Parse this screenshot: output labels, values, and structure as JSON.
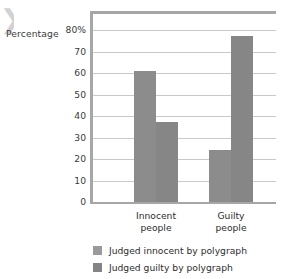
{
  "axis_title": "Percentage",
  "corner_mark": "❯",
  "chart_data": {
    "type": "bar",
    "title": "",
    "subtitle": "",
    "xlabel": "",
    "ylabel": "Percentage",
    "ylim": [
      0,
      80
    ],
    "ytick_values": [
      80,
      70,
      60,
      50,
      40,
      30,
      20,
      10,
      0
    ],
    "ytick_labels": [
      "80%",
      "70",
      "60",
      "50",
      "40",
      "30",
      "20",
      "10",
      "0"
    ],
    "grid": true,
    "legend_position": "bottom",
    "categories": [
      "Innocent people",
      "Guilty people"
    ],
    "category_lines": [
      [
        "Innocent",
        "people"
      ],
      [
        "Guilty",
        "people"
      ]
    ],
    "series": [
      {
        "name": "Judged innocent by polygraph",
        "color": "#8c8c8c",
        "values": [
          61,
          24
        ]
      },
      {
        "name": "Judged guilty by polygraph",
        "color": "#868686",
        "values": [
          37,
          77
        ]
      }
    ]
  },
  "legend": {
    "items": [
      {
        "label": "Judged innocent by polygraph",
        "color": "#9a9a9a"
      },
      {
        "label": "Judged guilty by polygraph",
        "color": "#848484"
      }
    ]
  },
  "colors": {
    "axis": "#a6a6a6",
    "grid": "#c9c9c9",
    "bar_light": "#8c8c8c",
    "bar_dark": "#868686",
    "text": "#2e2e2e",
    "background": "#ffffff"
  }
}
